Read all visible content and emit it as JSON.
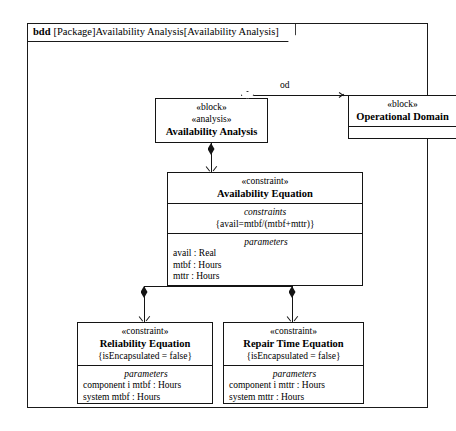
{
  "frame": {
    "kind": "bdd",
    "label": "[Package]Availability Analysis[Availability Analysis]"
  },
  "blocks": {
    "availability_analysis": {
      "stereotype1": "«block»",
      "stereotype2": "«analysis»",
      "name": "Availability Analysis"
    },
    "operational_domain": {
      "stereotype": "«block»",
      "name": "Operational Domain"
    },
    "availability_equation": {
      "stereotype": "«constraint»",
      "name": "Availability Equation",
      "constraints_title": "constraints",
      "constraint_expression": "{avail=mtbf/(mtbf+mttr)}",
      "parameters_title": "parameters",
      "parameters": [
        "avail : Real",
        "mtbf : Hours",
        "mttr : Hours"
      ]
    },
    "reliability_equation": {
      "stereotype": "«constraint»",
      "name": "Reliability Equation",
      "property": "{isEncapsulated = false}",
      "parameters_title": "parameters",
      "parameters": [
        "component i mtbf : Hours",
        "system mtbf : Hours"
      ]
    },
    "repair_time_equation": {
      "stereotype": "«constraint»",
      "name": "Repair Time Equation",
      "property": "{isEncapsulated = false}",
      "parameters_title": "parameters",
      "parameters": [
        "component i mttr : Hours",
        "system mttr : Hours"
      ]
    }
  },
  "connectors": {
    "od_label": "od"
  },
  "colors": {
    "line": "#141414",
    "background": "#ffffff"
  }
}
